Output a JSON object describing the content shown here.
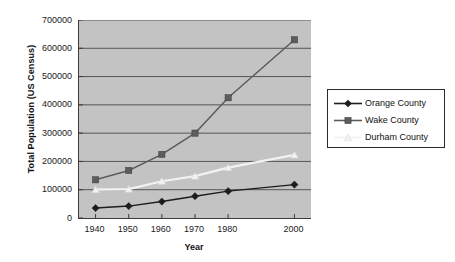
{
  "chart_data": {
    "type": "line",
    "title": "",
    "xlabel": "Year",
    "ylabel": "Total Population (US Census)",
    "categories": [
      "1940",
      "1950",
      "1960",
      "1970",
      "1980",
      "2000"
    ],
    "x": [
      1940,
      1950,
      1960,
      1970,
      1980,
      2000
    ],
    "xlim": [
      1935,
      2005
    ],
    "ylim": [
      0,
      700000
    ],
    "y_ticks": [
      "0",
      "100000",
      "200000",
      "300000",
      "400000",
      "500000",
      "600000",
      "700000"
    ],
    "y_tick_values": [
      0,
      100000,
      200000,
      300000,
      400000,
      500000,
      600000,
      700000
    ],
    "grid": true,
    "grid_axis": "y",
    "legend_position": "right",
    "plot_background": "#c3c3c3",
    "series": [
      {
        "name": "Orange County",
        "marker": "diamond",
        "color": "#1d1d1d",
        "values": [
          35000,
          42000,
          58000,
          77000,
          95000,
          118000
        ]
      },
      {
        "name": "Wake County",
        "marker": "square",
        "color": "#5c5c5c",
        "values": [
          135000,
          168000,
          225000,
          300000,
          425000,
          630000
        ]
      },
      {
        "name": "Durham County",
        "marker": "triangle",
        "color": "#f2f2f2",
        "values": [
          100000,
          102000,
          130000,
          148000,
          178000,
          223000
        ]
      }
    ]
  },
  "legend": {
    "entries": [
      {
        "label": "Orange County"
      },
      {
        "label": "Wake County"
      },
      {
        "label": "Durham County"
      }
    ]
  },
  "axes": {
    "y_title": "Total Population (US Census)",
    "x_title": "Year"
  }
}
